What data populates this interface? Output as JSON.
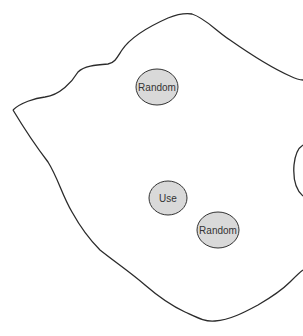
{
  "diagram": {
    "colors": {
      "outline": "#2b2b2b",
      "node_fill": "#d9d9d9",
      "node_stroke": "#333333"
    },
    "nodes": [
      {
        "id": "random-top",
        "label": "Random"
      },
      {
        "id": "use",
        "label": "Use"
      },
      {
        "id": "random-bottom",
        "label": "Random"
      }
    ]
  }
}
